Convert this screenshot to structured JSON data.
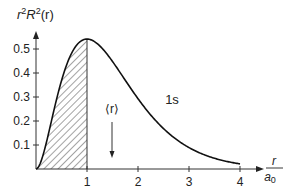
{
  "chart_data": {
    "type": "line",
    "title": "",
    "ylabel": "r²R²(r)",
    "ylabel_parts": {
      "r": "r",
      "r_sup": "2",
      "R": "R",
      "R_sup": "2",
      "arg": "(r)"
    },
    "xlabel": "r / a0",
    "xlabel_parts": {
      "num": "r",
      "den": "a",
      "den_sub": "0"
    },
    "xlim": [
      0,
      4.4
    ],
    "ylim": [
      0,
      0.58
    ],
    "x_ticks": [
      1,
      2,
      3,
      4
    ],
    "x_tick_labels": [
      "1",
      "2",
      "3",
      "4"
    ],
    "y_ticks": [
      0.1,
      0.2,
      0.3,
      0.4,
      0.5
    ],
    "y_tick_labels": [
      "0.1",
      "0.2",
      "0.3",
      "0.4",
      "0.5"
    ],
    "grid": false,
    "legend": null,
    "series": [
      {
        "name": "1s",
        "function": "4 x^2 e^(-2x)",
        "x": [
          0,
          0.25,
          0.5,
          0.75,
          1.0,
          1.25,
          1.5,
          1.75,
          2.0,
          2.5,
          3.0,
          3.5,
          4.0
        ],
        "values": [
          0,
          0.152,
          0.368,
          0.502,
          0.541,
          0.513,
          0.448,
          0.37,
          0.293,
          0.168,
          0.089,
          0.045,
          0.021
        ]
      }
    ],
    "shaded_region": {
      "x_from": 0,
      "x_to": 1,
      "pattern": "diagonal-hatch"
    },
    "annotations": [
      {
        "text": "1s",
        "x": 2.65,
        "y": 0.29
      },
      {
        "text": "⟨r⟩",
        "x": 1.5,
        "y": 0.25,
        "arrow_to_y": 0.05
      }
    ]
  },
  "labels": {
    "curve": "1s",
    "mean_r": "⟨r⟩",
    "y_r": "r",
    "y_r_sup": "2",
    "y_R": "R",
    "y_R_sup": "2",
    "y_arg": "(r)",
    "x_num": "r",
    "x_den": "a",
    "x_den_sub": "0",
    "xt1": "1",
    "xt2": "2",
    "xt3": "3",
    "xt4": "4",
    "yt1": "0.1",
    "yt2": "0.2",
    "yt3": "0.3",
    "yt4": "0.4",
    "yt5": "0.5"
  }
}
